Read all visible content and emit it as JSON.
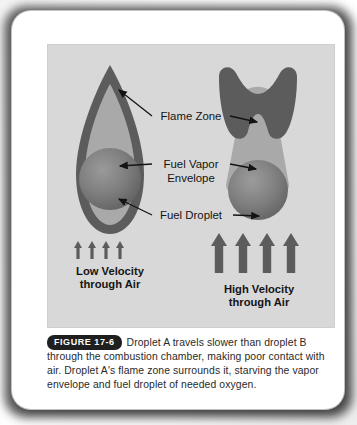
{
  "figure": {
    "badge_label": "FIGURE 17-6",
    "caption": "Droplet A travels slower than droplet B through the combustion chamber, making poor contact with air. Droplet A's flame zone surrounds it, starving the vapor envelope and fuel droplet of needed oxygen."
  },
  "diagram": {
    "labels": {
      "flame_zone": "Flame Zone",
      "fuel_vapor_line1": "Fuel Vapor",
      "fuel_vapor_line2": "Envelope",
      "fuel_droplet": "Fuel Droplet",
      "low_velocity_line1": "Low Velocity",
      "low_velocity_line2": "through Air",
      "high_velocity_line1": "High Velocity",
      "high_velocity_line2": "through Air"
    },
    "left_droplet": {
      "name": "Droplet A",
      "velocity": "Low Velocity through Air",
      "arrow_count": 4,
      "arrow_size": "small",
      "flame_shape": "teardrop-outline"
    },
    "right_droplet": {
      "name": "Droplet B",
      "velocity": "High Velocity through Air",
      "arrow_count": 4,
      "arrow_size": "large",
      "flame_shape": "bowtie-downstream"
    },
    "colors": {
      "panel_background": "#d8d8d8",
      "flame_zone": "#5c5c5c",
      "vapor_envelope": "#a9a9a9",
      "droplet_dark": "#6e6e6e",
      "droplet_light": "#8e8e8e",
      "arrow": "#5c5c5c",
      "leader_line": "#1a1a1a",
      "label_text": "#141414",
      "card_background": "#ffffff"
    }
  }
}
